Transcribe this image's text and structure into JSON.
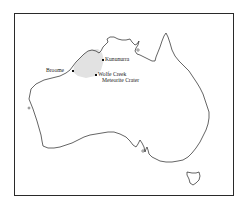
{
  "map": {
    "region": "Australia",
    "shaded_region": {
      "name": "Kimberley region",
      "color": "#e2e2e2"
    },
    "outline_color": "#222222",
    "frame_color": "#2a2a2a",
    "places": [
      {
        "name": "Broome",
        "label": "Broome",
        "x": 72,
        "y": 70
      },
      {
        "name": "Kununurra",
        "label": "Kununurra",
        "x": 102,
        "y": 59
      },
      {
        "name": "Wolfe Creek Meteorite Crater",
        "label_line1": "Wolfe Creek",
        "label_line2": "Meteorite Crater",
        "x": 95,
        "y": 74
      }
    ]
  }
}
